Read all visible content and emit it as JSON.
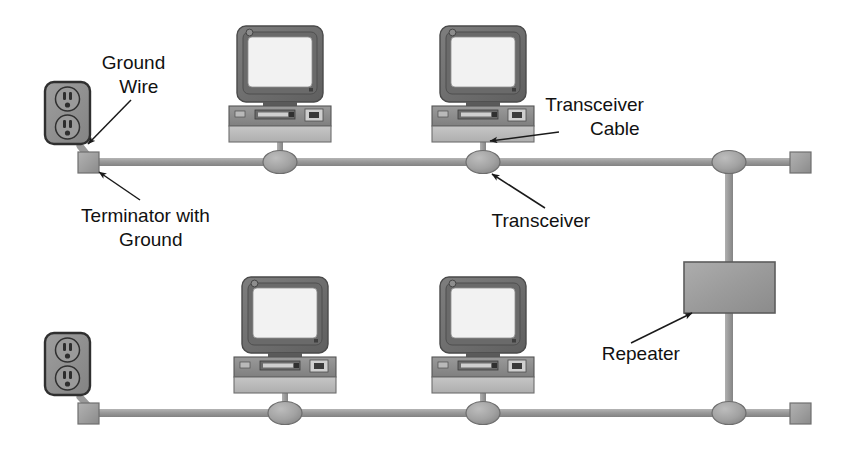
{
  "diagram": {
    "canvas": {
      "width": 858,
      "height": 453,
      "background": "#ffffff"
    },
    "colors": {
      "cable": "#9a9a9a",
      "cable_dark": "#7d7d7d",
      "terminator_fill": "#9d9d9d",
      "terminator_stroke": "#6f6f6f",
      "transceiver_fill": "#a2a2a2",
      "transceiver_stroke": "#6d6d6d",
      "repeater_fill": "#9b9b9b",
      "repeater_stroke": "#5d5d5d",
      "outlet_fill": "#8f8f8f",
      "outlet_stroke": "#3a3a3a",
      "monitor_bezel": "#6e6e6e",
      "monitor_screen": "#f2f2f2",
      "chassis_top": "#8a8a8a",
      "chassis_bottom": "#bcbcbc",
      "arrow": "#1a1a1a",
      "text": "#111111"
    },
    "labels": [
      {
        "id": "ground-wire",
        "lines": [
          "Ground",
          "Wire"
        ],
        "x": 152,
        "y": 69
      },
      {
        "id": "terminator-with-ground",
        "lines": [
          "Terminator with",
          "Ground"
        ],
        "x": 164,
        "y": 222
      },
      {
        "id": "transceiver-cable",
        "lines": [
          "Transceiver",
          "Cable"
        ],
        "x": 618,
        "y": 111
      },
      {
        "id": "transceiver",
        "lines": [
          "Transceiver"
        ],
        "x": 554,
        "y": 227
      },
      {
        "id": "repeater",
        "lines": [
          "Repeater"
        ],
        "x": 654,
        "y": 360
      }
    ],
    "segments": {
      "top_bus": {
        "y": 162,
        "x1": 88,
        "x2": 800,
        "label": "top bus cable"
      },
      "bottom_bus": {
        "y": 413,
        "x1": 88,
        "x2": 800,
        "label": "bottom bus cable"
      }
    },
    "terminators": [
      {
        "id": "top-left-terminator",
        "x": 88,
        "y": 162
      },
      {
        "id": "top-right-terminator",
        "x": 800,
        "y": 162
      },
      {
        "id": "bottom-left-terminator",
        "x": 88,
        "y": 413
      },
      {
        "id": "bottom-right-terminator",
        "x": 800,
        "y": 413
      }
    ],
    "transceivers": [
      {
        "id": "top-transceiver-1",
        "x": 280,
        "y": 162
      },
      {
        "id": "top-transceiver-2",
        "x": 483,
        "y": 162
      },
      {
        "id": "top-transceiver-repeater",
        "x": 729,
        "y": 162
      },
      {
        "id": "bottom-transceiver-1",
        "x": 285,
        "y": 413
      },
      {
        "id": "bottom-transceiver-2",
        "x": 483,
        "y": 413
      },
      {
        "id": "bottom-transceiver-repeater",
        "x": 729,
        "y": 413
      }
    ],
    "computers": [
      {
        "id": "computer-top-1",
        "x": 280,
        "y": 30
      },
      {
        "id": "computer-top-2",
        "x": 483,
        "y": 30
      },
      {
        "id": "computer-bottom-1",
        "x": 285,
        "y": 281
      },
      {
        "id": "computer-bottom-2",
        "x": 483,
        "y": 281
      }
    ],
    "outlets": [
      {
        "id": "outlet-top",
        "x": 45,
        "y": 82
      },
      {
        "id": "outlet-bottom",
        "x": 45,
        "y": 333
      }
    ],
    "repeater": {
      "id": "repeater-box",
      "x": 684,
      "y": 262,
      "width": 91,
      "height": 51
    }
  }
}
